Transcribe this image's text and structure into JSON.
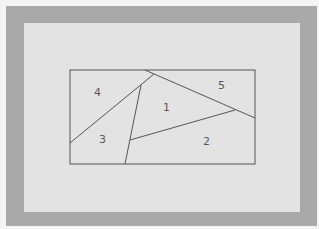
{
  "diagram": {
    "type": "rectangle-partition",
    "medium": "hand-drawn pencil sketch on paper, photographed on a gray board",
    "colors": {
      "background": "#f4f4f4",
      "board": "#a9a9a9",
      "paper": "#e3e3e3",
      "ink": "#555555"
    },
    "rectangle": {
      "x": 70,
      "y": 70,
      "width": 185,
      "height": 94
    },
    "lines": [
      {
        "id": "l1",
        "x1": 145,
        "y1": 70,
        "x2": 255,
        "y2": 118
      },
      {
        "id": "l2",
        "x1": 70,
        "y1": 143,
        "x2": 154,
        "y2": 74
      },
      {
        "id": "l3",
        "x1": 141,
        "y1": 85,
        "x2": 125,
        "y2": 164
      },
      {
        "id": "l4",
        "x1": 130,
        "y1": 140,
        "x2": 235,
        "y2": 110
      }
    ],
    "regions": [
      {
        "label": "4",
        "x": 98,
        "y": 96
      },
      {
        "label": "5",
        "x": 222,
        "y": 89
      },
      {
        "label": "1",
        "x": 167,
        "y": 111
      },
      {
        "label": "3",
        "x": 103,
        "y": 143
      },
      {
        "label": "2",
        "x": 207,
        "y": 145
      }
    ]
  }
}
